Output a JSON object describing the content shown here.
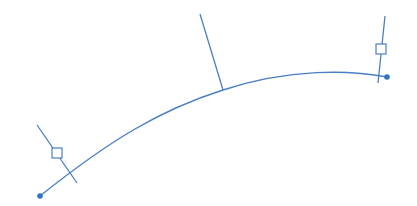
{
  "diagram": {
    "type": "curve-with-perpendicular-markers",
    "colors": {
      "stroke": "#4a7fc4",
      "point": "#2f75c0",
      "background": "#ffffff"
    },
    "curve": {
      "start": [
        40,
        196
      ],
      "control": [
        200,
        80
      ],
      "end": [
        387,
        77
      ],
      "path": "M40,196 C110,140 160,110 223,90 C290,68 350,70 387,77"
    },
    "endpoints": [
      {
        "name": "start-point",
        "x": 40,
        "y": 196
      },
      {
        "name": "end-point",
        "x": 387,
        "y": 77
      }
    ],
    "markers": [
      {
        "name": "left-normal-line",
        "x1": 37,
        "y1": 125,
        "x2": 77,
        "y2": 183
      },
      {
        "name": "center-normal-line",
        "x1": 200,
        "y1": 14,
        "x2": 223,
        "y2": 90
      },
      {
        "name": "right-normal-line",
        "x1": 385,
        "y1": 16,
        "x2": 378,
        "y2": 83
      }
    ],
    "squares": [
      {
        "name": "left-square-handle",
        "x": 52,
        "y": 148,
        "size": 10
      },
      {
        "name": "right-square-handle",
        "x": 376,
        "y": 44,
        "size": 10
      }
    ]
  }
}
